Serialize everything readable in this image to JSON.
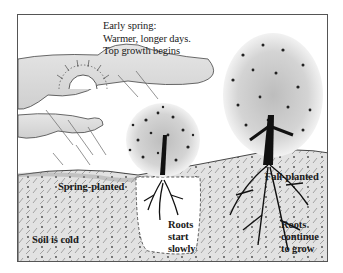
{
  "figure": {
    "type": "illustration",
    "caption_top": {
      "lines": [
        "Early spring:",
        "Warmer, longer days.",
        "Top growth begins"
      ]
    },
    "labels": {
      "spring_planted": "Spring-planted",
      "fall_planted": "Fall-planted",
      "soil": "Soil is cold",
      "roots_start": [
        "Roots",
        "start",
        "slowly"
      ],
      "roots_continue": [
        "Roots",
        "continue",
        "to grow"
      ]
    },
    "elements": {
      "sun_icon": "sun-icon",
      "cloud_icon": "cloud-icon",
      "rain_icon": "rain-icon",
      "small_tree": "spring-planted-tree",
      "large_tree": "fall-planted-tree"
    },
    "colors": {
      "ink": "#111111",
      "soil_shade": "#d8d8d8",
      "canopy_shade": "#c9c9c9",
      "background": "#ffffff"
    }
  }
}
